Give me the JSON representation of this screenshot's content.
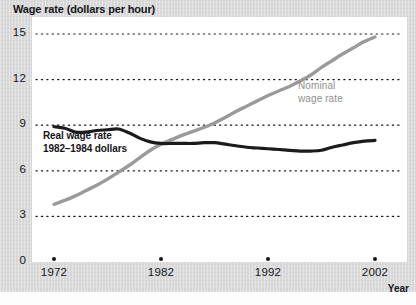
{
  "chart_data": {
    "type": "line",
    "title": "Wage rate (dollars per hour)",
    "xlabel": "Year",
    "ylabel": "Wage rate (dollars per hour)",
    "xlim": [
      1972,
      2002
    ],
    "ylim": [
      0,
      15
    ],
    "grid": true,
    "grid_style": "dotted-horizontal",
    "legend_position": "inline-annotations",
    "yticks": [
      "0",
      "3",
      "6",
      "9",
      "12",
      "15"
    ],
    "ytick_values": [
      0,
      3,
      6,
      9,
      12,
      15
    ],
    "xticks": [
      "1972",
      "1982",
      "1992",
      "2002"
    ],
    "xtick_values": [
      1972,
      1982,
      1992,
      2002
    ],
    "series": [
      {
        "name": "Nominal wage rate",
        "label_line1": "Nominal",
        "label_line2": "wage rate",
        "color": "#9a9a9a",
        "x": [
          1972,
          1973,
          1974,
          1975,
          1976,
          1977,
          1978,
          1979,
          1980,
          1981,
          1982,
          1983,
          1984,
          1985,
          1986,
          1987,
          1988,
          1989,
          1990,
          1991,
          1992,
          1993,
          1994,
          1995,
          1996,
          1997,
          1998,
          1999,
          2000,
          2001,
          2002
        ],
        "values": [
          3.8,
          4.05,
          4.35,
          4.7,
          5.05,
          5.45,
          5.9,
          6.35,
          6.85,
          7.35,
          7.75,
          8.05,
          8.35,
          8.6,
          8.85,
          9.15,
          9.5,
          9.9,
          10.25,
          10.6,
          10.95,
          11.25,
          11.55,
          11.9,
          12.3,
          12.8,
          13.25,
          13.7,
          14.1,
          14.5,
          14.8
        ]
      },
      {
        "name": "Real wage rate 1982-1984 dollars",
        "label_line1": "Real wage rate",
        "label_line2": "1982–1984 dollars",
        "color": "#1b1b1b",
        "x": [
          1972,
          1973,
          1974,
          1975,
          1976,
          1977,
          1978,
          1979,
          1980,
          1981,
          1982,
          1983,
          1984,
          1985,
          1986,
          1987,
          1988,
          1989,
          1990,
          1991,
          1992,
          1993,
          1994,
          1995,
          1996,
          1997,
          1998,
          1999,
          2000,
          2001,
          2002
        ],
        "values": [
          8.9,
          8.8,
          8.55,
          8.55,
          8.65,
          8.7,
          8.75,
          8.5,
          8.15,
          7.9,
          7.8,
          7.8,
          7.8,
          7.8,
          7.85,
          7.85,
          7.75,
          7.65,
          7.55,
          7.5,
          7.45,
          7.4,
          7.35,
          7.3,
          7.3,
          7.35,
          7.55,
          7.7,
          7.85,
          7.95,
          8.0
        ]
      }
    ]
  },
  "figure": {
    "title": "Wage rate (dollars per hour)",
    "x_axis_title": "Year"
  }
}
